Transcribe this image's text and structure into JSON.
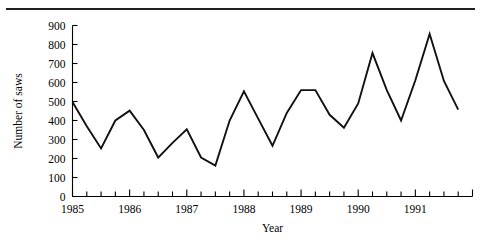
{
  "figure": {
    "has_top_rule": true,
    "background_color": "#ffffff",
    "line_color": "#111111",
    "axis_color": "#000000"
  },
  "chart_data": {
    "type": "line",
    "title": "",
    "subtitle": "",
    "xlabel": "Year",
    "ylabel": "Number of saws",
    "xlim": [
      1985.0,
      1992.0
    ],
    "ylim": [
      0,
      900
    ],
    "grid": false,
    "legend": null,
    "legend_position": "none",
    "y_ticks": [
      0,
      100,
      200,
      300,
      400,
      500,
      600,
      700,
      800,
      900
    ],
    "y_tick_labels": [
      "0",
      "100",
      "200",
      "300",
      "400",
      "500",
      "600",
      "700",
      "800",
      "900"
    ],
    "x_tick_labels": [
      "1985",
      "1986",
      "1987",
      "1988",
      "1989",
      "1990",
      "1991"
    ],
    "x_tick_label_values": [
      1985,
      1986,
      1987,
      1988,
      1989,
      1990,
      1991
    ],
    "minor_ticks_per_year": 4,
    "x_minor_tick_values": [
      1985.0,
      1985.25,
      1985.5,
      1985.75,
      1986.0,
      1986.25,
      1986.5,
      1986.75,
      1987.0,
      1987.25,
      1987.5,
      1987.75,
      1988.0,
      1988.25,
      1988.5,
      1988.75,
      1989.0,
      1989.25,
      1989.5,
      1989.75,
      1990.0,
      1990.25,
      1990.5,
      1990.75,
      1991.0,
      1991.25,
      1991.5,
      1991.75,
      1992.0
    ],
    "series": [
      {
        "name": "Number of saws",
        "x": [
          1985.0,
          1985.25,
          1985.5,
          1985.75,
          1986.0,
          1986.25,
          1986.5,
          1986.75,
          1987.0,
          1987.25,
          1987.5,
          1987.75,
          1988.0,
          1988.25,
          1988.5,
          1988.75,
          1989.0,
          1989.25,
          1989.5,
          1989.75,
          1990.0,
          1990.25,
          1990.5,
          1990.75,
          1991.0,
          1991.25,
          1991.5,
          1991.75
        ],
        "values": [
          497,
          370,
          253,
          400,
          452,
          350,
          205,
          282,
          353,
          205,
          163,
          400,
          553,
          410,
          267,
          440,
          560,
          560,
          430,
          362,
          490,
          755,
          560,
          400,
          612,
          855,
          608,
          457
        ]
      }
    ]
  }
}
